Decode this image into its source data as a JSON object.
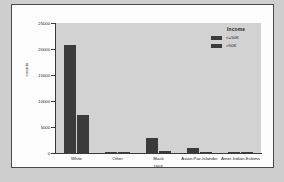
{
  "chart_data": {
    "type": "bar",
    "title": "",
    "xlabel": "race",
    "ylabel": "counts",
    "categories": [
      "White",
      "Other",
      "Black",
      "Asian-Pac-Islander",
      "Amer-Indian-Eskimo"
    ],
    "series": [
      {
        "name": "<=50K",
        "values": [
          20700,
          270,
          2800,
          900,
          280
        ]
      },
      {
        "name": ">50K",
        "values": [
          7400,
          50,
          390,
          280,
          30
        ]
      }
    ],
    "ylim": [
      0,
      25000
    ],
    "yticks": [
      0,
      5000,
      10000,
      15000,
      20000,
      25000
    ],
    "ytick_labels": [
      "0",
      "5000",
      "10000",
      "15000",
      "20000",
      "25000"
    ],
    "grid": false,
    "legend": {
      "title": "Income",
      "position": "top-right",
      "entries": [
        "<=50K",
        ">50K"
      ]
    },
    "colors": {
      "bar": "#3b3b3b",
      "panel_background": "#d2d2d2",
      "figure_background": "#fdfdfd",
      "axis": "#3a3a3a",
      "text": "#1c1c1c"
    }
  }
}
